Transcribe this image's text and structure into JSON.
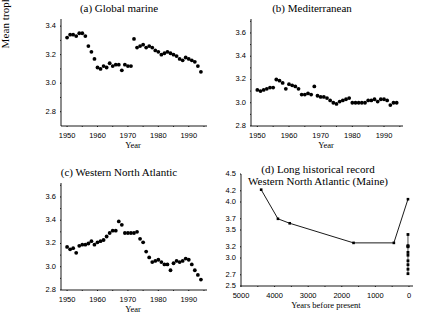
{
  "figure": {
    "shared_ylabel": "Mean trophic level",
    "background": "#ffffff",
    "ink": "#000000"
  },
  "chart_data": [
    {
      "type": "scatter",
      "panel": "a",
      "title": "(a) Global marine",
      "xlabel": "Year",
      "ylabel": "Mean trophic level",
      "xlim": [
        1948,
        1996
      ],
      "ylim": [
        2.7,
        3.45
      ],
      "yticks": [
        2.8,
        3.0,
        3.2,
        3.4
      ],
      "ytick_labels": [
        "2.8",
        "3.0",
        "3.2",
        "3.4"
      ],
      "xticks": [
        1950,
        1960,
        1970,
        1980,
        1990
      ],
      "xtick_labels": [
        "1950",
        "1960",
        "1970",
        "1980",
        "1990"
      ],
      "minor_xticks": [
        1955,
        1965,
        1975,
        1985,
        1995
      ],
      "grid": false,
      "legend": null,
      "marker": "filled-circle",
      "x": [
        1950,
        1951,
        1952,
        1953,
        1954,
        1955,
        1956,
        1957,
        1958,
        1959,
        1960,
        1961,
        1962,
        1963,
        1964,
        1965,
        1966,
        1967,
        1968,
        1969,
        1970,
        1971,
        1972,
        1973,
        1974,
        1975,
        1976,
        1977,
        1978,
        1979,
        1980,
        1981,
        1982,
        1983,
        1984,
        1985,
        1986,
        1987,
        1988,
        1989,
        1990,
        1991,
        1992,
        1993,
        1994
      ],
      "y": [
        3.32,
        3.34,
        3.34,
        3.33,
        3.35,
        3.35,
        3.33,
        3.26,
        3.22,
        3.17,
        3.11,
        3.1,
        3.12,
        3.11,
        3.14,
        3.12,
        3.13,
        3.13,
        3.09,
        3.13,
        3.12,
        3.12,
        3.31,
        3.25,
        3.26,
        3.27,
        3.25,
        3.26,
        3.25,
        3.23,
        3.22,
        3.2,
        3.21,
        3.22,
        3.21,
        3.2,
        3.19,
        3.17,
        3.16,
        3.18,
        3.17,
        3.16,
        3.15,
        3.12,
        3.08
      ]
    },
    {
      "type": "scatter",
      "panel": "b",
      "title": "(b) Mediterranean",
      "xlabel": "Year",
      "ylabel": "Mean trophic level",
      "xlim": [
        1948,
        1996
      ],
      "ylim": [
        2.8,
        3.72
      ],
      "yticks": [
        2.8,
        3.0,
        3.2,
        3.4,
        3.6
      ],
      "ytick_labels": [
        "2.8",
        "3.0",
        "3.2",
        "3.4",
        "3.6"
      ],
      "xticks": [
        1950,
        1960,
        1970,
        1980,
        1990
      ],
      "xtick_labels": [
        "1950",
        "1960",
        "1970",
        "1980",
        "1990"
      ],
      "minor_xticks": [
        1955,
        1965,
        1975,
        1985,
        1995
      ],
      "grid": false,
      "legend": null,
      "marker": "filled-circle",
      "x": [
        1950,
        1951,
        1952,
        1953,
        1954,
        1955,
        1956,
        1957,
        1958,
        1959,
        1960,
        1961,
        1962,
        1963,
        1964,
        1965,
        1966,
        1967,
        1968,
        1969,
        1970,
        1971,
        1972,
        1973,
        1974,
        1975,
        1976,
        1977,
        1978,
        1979,
        1980,
        1981,
        1982,
        1983,
        1984,
        1985,
        1986,
        1987,
        1988,
        1989,
        1990,
        1991,
        1992,
        1993,
        1994
      ],
      "y": [
        3.11,
        3.1,
        3.11,
        3.12,
        3.13,
        3.13,
        3.2,
        3.19,
        3.17,
        3.12,
        3.16,
        3.15,
        3.14,
        3.12,
        3.07,
        3.07,
        3.08,
        3.07,
        3.14,
        3.06,
        3.05,
        3.05,
        3.04,
        3.02,
        3.0,
        2.99,
        3.01,
        3.02,
        3.03,
        3.04,
        3.0,
        3.0,
        3.0,
        3.0,
        3.0,
        3.02,
        3.02,
        3.03,
        3.01,
        3.03,
        3.03,
        3.02,
        2.98,
        3.0,
        3.0
      ]
    },
    {
      "type": "scatter",
      "panel": "c",
      "title": "(c) Western North Atlantic",
      "xlabel": "Year",
      "ylabel": "Mean trophic level",
      "xlim": [
        1948,
        1996
      ],
      "ylim": [
        2.8,
        3.72
      ],
      "yticks": [
        2.8,
        3.0,
        3.2,
        3.4,
        3.6
      ],
      "ytick_labels": [
        "2.8",
        "3.0",
        "3.2",
        "3.4",
        "3.6"
      ],
      "xticks": [
        1950,
        1960,
        1970,
        1980,
        1990
      ],
      "xtick_labels": [
        "1950",
        "1960",
        "1970",
        "1980",
        "1990"
      ],
      "minor_xticks": [
        1955,
        1965,
        1975,
        1985,
        1995
      ],
      "grid": false,
      "legend": null,
      "marker": "filled-circle",
      "x": [
        1950,
        1951,
        1952,
        1953,
        1954,
        1955,
        1956,
        1957,
        1958,
        1959,
        1960,
        1961,
        1962,
        1963,
        1964,
        1965,
        1966,
        1967,
        1968,
        1969,
        1970,
        1971,
        1972,
        1973,
        1974,
        1975,
        1976,
        1977,
        1978,
        1979,
        1980,
        1981,
        1982,
        1983,
        1984,
        1985,
        1986,
        1987,
        1988,
        1989,
        1990,
        1991,
        1992,
        1993,
        1994
      ],
      "y": [
        3.17,
        3.15,
        3.16,
        3.12,
        3.18,
        3.19,
        3.19,
        3.2,
        3.22,
        3.19,
        3.21,
        3.22,
        3.23,
        3.26,
        3.29,
        3.31,
        3.31,
        3.39,
        3.36,
        3.29,
        3.29,
        3.29,
        3.29,
        3.3,
        3.24,
        3.21,
        3.13,
        3.08,
        3.04,
        3.05,
        3.06,
        3.04,
        3.02,
        3.02,
        2.97,
        3.03,
        3.05,
        3.04,
        3.05,
        3.07,
        3.06,
        3.02,
        2.97,
        2.93,
        2.89
      ]
    },
    {
      "type": "line",
      "panel": "d",
      "title_line1": "(d) Long historical record",
      "title_line2": "Western North Atlantic (Maine)",
      "xlabel": "Years before present",
      "ylabel": "Mean trophic level",
      "xlim": [
        5000,
        -120
      ],
      "ylim": [
        2.5,
        4.5
      ],
      "yticks": [
        2.5,
        2.7,
        3.0,
        3.2,
        3.5,
        3.7,
        4.0,
        4.2,
        4.5
      ],
      "ytick_labels": [
        "2.5",
        "2.7",
        "3.0",
        "3.2",
        "3.5",
        "3.7",
        "4.0",
        "4.2",
        "4.5"
      ],
      "xticks": [
        5000,
        4000,
        3000,
        2000,
        1000,
        0
      ],
      "xtick_labels": [
        "5000",
        "4000",
        "3000",
        "2000",
        "1000",
        "0"
      ],
      "minor_xticks": [
        4500,
        3500,
        2500,
        1500,
        500
      ],
      "grid": false,
      "legend": null,
      "marker": "filled-square-small",
      "x": [
        4400,
        3900,
        3550,
        1650,
        450,
        30
      ],
      "y": [
        4.22,
        3.7,
        3.62,
        3.27,
        3.27,
        4.05
      ],
      "modern_cluster": {
        "x": 30,
        "y": [
          3.42,
          3.22,
          3.21,
          3.2,
          3.1,
          3.05,
          2.95,
          2.88,
          2.8,
          2.72
        ]
      }
    }
  ]
}
